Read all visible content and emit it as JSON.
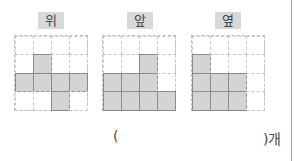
{
  "views": [
    {
      "label": "위",
      "name": "top",
      "filled": [
        [
          0,
          0,
          0,
          0
        ],
        [
          0,
          1,
          0,
          0
        ],
        [
          1,
          1,
          1,
          1
        ],
        [
          0,
          0,
          1,
          0
        ]
      ]
    },
    {
      "label": "앞",
      "name": "front",
      "filled": [
        [
          0,
          0,
          0,
          0
        ],
        [
          0,
          0,
          1,
          0
        ],
        [
          1,
          1,
          1,
          0
        ],
        [
          1,
          1,
          1,
          1
        ]
      ]
    },
    {
      "label": "옆",
      "name": "side",
      "filled": [
        [
          0,
          0,
          0,
          0
        ],
        [
          1,
          0,
          0,
          0
        ],
        [
          1,
          1,
          1,
          0
        ],
        [
          1,
          1,
          1,
          0
        ]
      ]
    }
  ],
  "answer": {
    "open_paren": "(",
    "value": "",
    "close_unit": ")개"
  },
  "colors": {
    "filled_cell": "#d4d4d4",
    "label_bg": "#d9d9d9",
    "grid_line": "#c8c8c8"
  }
}
